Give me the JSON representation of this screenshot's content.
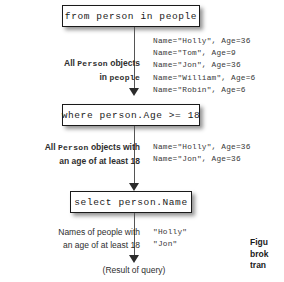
{
  "diagram": {
    "background_color": "#ffffff",
    "box_border_color": "#1a1a1a",
    "text_color": "#2e2e2e",
    "steps": [
      {
        "id": "from",
        "code": "from person in people",
        "annotation_html": "All <span class=\"mono\">Person</span> objects<br>in <span class=\"mono\">people</span>",
        "annotation_bold": true,
        "output": "Name=\"Holly\", Age=36\nName=\"Tom\", Age=9\nName=\"Jon\", Age=36\nName=\"William\", Age=6\nName=\"Robin\", Age=6"
      },
      {
        "id": "where",
        "code": "where person.Age >= 18",
        "annotation_html": "All <span class=\"mono\">Person</span> objects with<br>an age of at least 18",
        "annotation_bold": true,
        "output": "Name=\"Holly\", Age=36\nName=\"Jon\", Age=36"
      },
      {
        "id": "select",
        "code": "select person.Name",
        "annotation_html": "Names of people with<br>an age of at least 18",
        "annotation_bold": false,
        "output": "\"Holly\"\n\"Jon\""
      }
    ],
    "result_label": "(Result of query)",
    "caption_lines": "Figu\nbrok\ntran"
  }
}
